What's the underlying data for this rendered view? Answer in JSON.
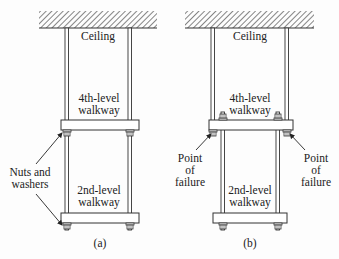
{
  "figure_a": {
    "ceiling": "Ceiling",
    "walkway_top": [
      "4th-level",
      "walkway"
    ],
    "walkway_bottom": [
      "2nd-level",
      "walkway"
    ],
    "callout": [
      "Nuts and",
      "washers"
    ],
    "caption": "(a)"
  },
  "figure_b": {
    "ceiling": "Ceiling",
    "walkway_top": [
      "4th-level",
      "walkway"
    ],
    "walkway_bottom": [
      "2nd-level",
      "walkway"
    ],
    "callout_left": [
      "Point",
      "of",
      "failure"
    ],
    "callout_right": [
      "Point",
      "of",
      "failure"
    ],
    "caption": "(b)"
  }
}
